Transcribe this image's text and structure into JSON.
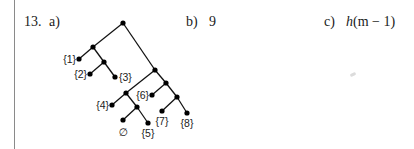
{
  "problem": {
    "number": "13.",
    "part_a_label": "a)",
    "part_b_label": "b)",
    "part_b_answer": "9",
    "part_c_label": "c)",
    "part_c_answer_var": "h",
    "part_c_answer_rest": "(m − 1)"
  },
  "tree": {
    "nodes": [
      {
        "id": "root"
      },
      {
        "id": "n1",
        "parent": "root"
      },
      {
        "id": "leaf1",
        "parent": "n1",
        "label": "{1}"
      },
      {
        "id": "n2",
        "parent": "n1"
      },
      {
        "id": "leaf2",
        "parent": "n2",
        "label": "{2}"
      },
      {
        "id": "leaf3",
        "parent": "n2",
        "label": "{3}"
      },
      {
        "id": "n3",
        "parent": "root"
      },
      {
        "id": "n4",
        "parent": "n3"
      },
      {
        "id": "leaf4",
        "parent": "n4",
        "label": "{4}"
      },
      {
        "id": "n5",
        "parent": "n4"
      },
      {
        "id": "leafempty",
        "parent": "n5",
        "label": "∅"
      },
      {
        "id": "leaf5",
        "parent": "n5",
        "label": "{5}"
      },
      {
        "id": "n6",
        "parent": "n3"
      },
      {
        "id": "leaf6",
        "parent": "n6",
        "label": "{6}"
      },
      {
        "id": "n7",
        "parent": "n6"
      },
      {
        "id": "leaf7",
        "parent": "n7",
        "label": "{7}"
      },
      {
        "id": "leaf8",
        "parent": "n7",
        "label": "{8}"
      }
    ]
  }
}
